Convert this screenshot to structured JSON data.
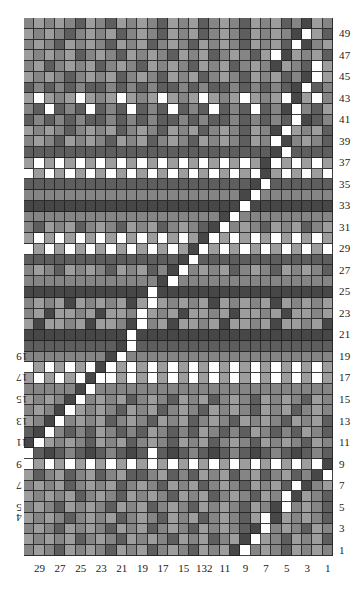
{
  "chart_data": {
    "type": "heatmap",
    "title": "",
    "subtitle": "",
    "xlabel": "",
    "ylabel": "",
    "grid": {
      "columns": 30,
      "rows": 50
    },
    "legend_position": "none",
    "grid_lines": true,
    "palette": {
      "white": "#ffffff",
      "light": "#9d9d9d",
      "mid": "#858585",
      "dark": "#5e5e5e",
      "darkest": "#474747",
      "gridline": "#1e1e1e",
      "background": "#ffffff",
      "text": "#1a1a1a"
    },
    "palette_keys": [
      "W",
      "L",
      "M",
      "D",
      "K"
    ],
    "row_labels_right": [
      49,
      47,
      45,
      43,
      41,
      39,
      37,
      35,
      33,
      31,
      29,
      27,
      25,
      23,
      21,
      19,
      17,
      15,
      13,
      11,
      9,
      7,
      5,
      3,
      1
    ],
    "row_labels_left": [
      19,
      17,
      15,
      13,
      11,
      9,
      7,
      5,
      4
    ],
    "row_labels_left_rotated": true,
    "column_labels": [
      29,
      27,
      25,
      23,
      21,
      19,
      17,
      15,
      "132",
      11,
      9,
      7,
      5,
      3,
      1
    ],
    "column_label_positions": [
      29,
      27,
      25,
      23,
      21,
      19,
      17,
      15,
      13,
      11,
      9,
      7,
      5,
      3,
      1
    ],
    "rows_top_to_bottom": [
      "MLMLMDLMDLMLMDLMLDMLMDLMLDMKLM",
      "LMLMDMLMLDMLMDLMLDMLMDLMLMKWLD",
      "MLMDLMLMDLMLDMLMDLMLMDLMLDWKML",
      "LMLMLDMLMDLMLMDLMLDMLMDLWKLMLD",
      "MLDMLMLDMLMDLMLMDLMLDMLMKLMDWL",
      "LMLMDMLMLDMLMDLMLDMLMDLMLDMKWL",
      "DMDMDMDDMDMDMDDMDMDDMDMDMDKWDM",
      "LWLMLWLMLWLMLWLMLWLMLWLMLWKLWM",
      "MDWDMDWDMDWDMDWDMDWDMDWDMKWMDL",
      "DMDMDMDDMDMDMDDMDMDDMDMDMDWKDM",
      "LMLMDMLMLDMLMDLMLDMLMDLMKWLMLD",
      "MLMDLMLMDLMLDMLMDLMLMDLMWKMLMD",
      "DDDDDDDDDDDDDDDDDDDDDDDDKWDDDD",
      "LWLWLWLWLWLWLWLWLWLWLWLKWLWLWL",
      "WLWLWLWLWLWLWLWLWLWLWLWKLWLWLW",
      "DDDDDDDDDDDDDDDDDDDDDDKWDDDDDD",
      "MMMMMMMMMMMMMMMMMMMMMKWMMMMMMM",
      "KKKKKKKKKKKKKKKKKKKKKWKKKKKKKK",
      "MMMMMMMMMMMMMMMMMMMKWMMMMMMMMM",
      "MDLMLDMLMDLMLDMLMDKWMLMDLMLDML",
      "LWLWLWLWLWLWLWLWLKWLWLWLWLWLWL",
      "WLWLWLWLWLWLWLWLKWLWLWLWLWLWLW",
      "DDDDDDDDDDDDDDDKWDDDDDDDDDDDDD",
      "MLMDLMLMDLMLDMKWMLMLDMLMDLMLMD",
      "MMMMMMMMMMMMMKWMMMMMMMMMMMMMMM",
      "KKKKKKKKKKKKWKKKKKKKKKKKKKKKKK",
      "MLMLKLMLMLKLWLMLMLKLMLMLKLMLML",
      "MLKLLMLKLLMWLMLKLLMLKLLMLKLLML",
      "LKLLMLKLLMKWMLKLLMLKLLMLKLLMLK",
      "KKKKKKKKKKWKKKKKKKKKKKKKKKKKKK",
      "DDDDDDDDDKWDDDDDDDDDDDDDDDDDDD",
      "MMMMMMMMKWMMMMMMMMMMMMMMMMMMMM",
      "WLWLWLWKWLWLWLWLWLWLWLWLWLWLWL",
      "LWLWLWKWWLWLWLWLWLWLWLWLWLWLWL",
      "MMMMMKWMMMMMMMMMMMMMMMMMMMMMMM",
      "LMLMKWMLMLDMLMDLMLDMLMDLMLMDLM",
      "MLMKWLMLMDLMLDMLMDLMLMDLMLDMLM",
      "LMKWMLMLDMLMDLMLDMLMDLMLMDLMLD",
      "DKWMDMDLMDMDLMDMDLMDMDLMDMDLMD",
      "KWLMLMDLMLDMLMDLMLDMLMDLMLMDLM",
      "WDKDMDKDMDKDWDKDMDKDMDKDMDKDMD",
      "WLWLWLWLWLWLWLWLWLWLWLWLWLWLWK",
      "LDMLDMLDMLDDMLDMDLMLDMLDMLDMKW",
      "MLMLDMLMLDMLMDLMLDMLMDLMLDWKML",
      "LMLMLDMLMDLMLMDLMLDMLMDLMWKLMD",
      "MLMDLMLMDLMLDMLMDLMLMDLMKWMLMD",
      "LMLMDMLMLDMLMDLMLDMLMDLWKLMLMD",
      "MLMDLMLMDLMLDMLMDLMLMDKWMLMDLM",
      "LMLMLDMLMDLMLMDLMLDMLKWLMDLMLD",
      "MLMDLMLMDLMLDMLMDLMLKWMLMDLMLM"
    ]
  }
}
